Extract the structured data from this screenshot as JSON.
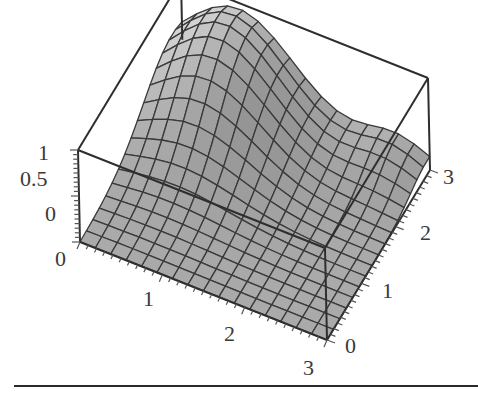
{
  "chart_data": {
    "type": "surface3d",
    "title": "",
    "xlabel": "",
    "ylabel": "",
    "zlabel": "",
    "x_range": [
      0,
      3
    ],
    "y_range": [
      0,
      3
    ],
    "z_range": [
      0,
      1
    ],
    "x_ticks": [
      "0",
      "1",
      "2",
      "3"
    ],
    "y_ticks": [
      "0",
      "1",
      "2",
      "3"
    ],
    "z_ticks": [
      "0",
      "0.5",
      "1"
    ],
    "grid_resolution": [
      16,
      16
    ],
    "surface_description": "Smooth bump rising to ~1 near x=0.5..1, y=2..3 (back-left), decaying toward 0 elsewhere; shaded gray with dark mesh lines",
    "peak": {
      "x": 0.7,
      "y": 2.6,
      "z": 1.0
    },
    "box": true,
    "grid": false,
    "legend": "none",
    "colors": {
      "surface": "#a8a8a8",
      "mesh": "#3a3a3a",
      "box": "#2e2e2e"
    }
  },
  "labels": {
    "z": [
      "1",
      "0.5",
      "0"
    ],
    "x": [
      "0",
      "1",
      "2",
      "3"
    ],
    "y": [
      "0",
      "1",
      "2",
      "3"
    ]
  }
}
